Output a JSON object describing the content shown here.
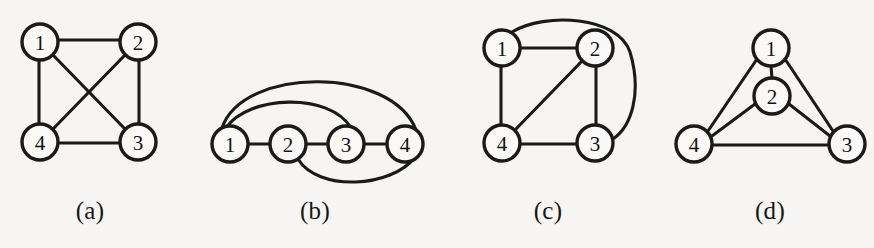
{
  "figure": {
    "background_color": "#f6f5f3",
    "ink_color": "#1a1a18",
    "node_fill_color": "#faf9f7",
    "panel_count": 4
  },
  "panels": [
    {
      "id": "a",
      "caption": "(a)",
      "layout": "square with both diagonals crossing",
      "node_labels": [
        "1",
        "2",
        "3",
        "4"
      ],
      "nodes": [
        {
          "label": "1",
          "cx": 40,
          "cy": 42,
          "r": 18
        },
        {
          "label": "2",
          "cx": 138,
          "cy": 42,
          "r": 18
        },
        {
          "label": "3",
          "cx": 138,
          "cy": 142,
          "r": 18
        },
        {
          "label": "4",
          "cx": 40,
          "cy": 142,
          "r": 18
        }
      ],
      "edges": [
        {
          "from": "1",
          "to": "2",
          "kind": "straight"
        },
        {
          "from": "2",
          "to": "3",
          "kind": "straight"
        },
        {
          "from": "3",
          "to": "4",
          "kind": "straight"
        },
        {
          "from": "4",
          "to": "1",
          "kind": "straight"
        },
        {
          "from": "1",
          "to": "3",
          "kind": "straight-diagonal"
        },
        {
          "from": "2",
          "to": "4",
          "kind": "straight-diagonal"
        }
      ],
      "edge_count": 6,
      "crossings": 1
    },
    {
      "id": "b",
      "caption": "(b)",
      "layout": "vertices in a row with arcs above and below",
      "node_labels": [
        "1",
        "2",
        "3",
        "4"
      ],
      "nodes": [
        {
          "label": "1",
          "cx": 230,
          "cy": 144,
          "r": 18
        },
        {
          "label": "2",
          "cx": 288,
          "cy": 144,
          "r": 18
        },
        {
          "label": "3",
          "cx": 346,
          "cy": 144,
          "r": 18
        },
        {
          "label": "4",
          "cx": 405,
          "cy": 144,
          "r": 18
        }
      ],
      "edges": [
        {
          "from": "1",
          "to": "2",
          "kind": "straight"
        },
        {
          "from": "2",
          "to": "3",
          "kind": "straight"
        },
        {
          "from": "3",
          "to": "4",
          "kind": "straight"
        },
        {
          "from": "1",
          "to": "3",
          "kind": "arc-above"
        },
        {
          "from": "1",
          "to": "4",
          "kind": "arc-above-large"
        },
        {
          "from": "2",
          "to": "4",
          "kind": "arc-below"
        }
      ],
      "edge_count": 6,
      "crossings": 1
    },
    {
      "id": "c",
      "caption": "(c)",
      "layout": "square with one diagonal and an outer curved edge",
      "node_labels": [
        "1",
        "2",
        "3",
        "4"
      ],
      "nodes": [
        {
          "label": "1",
          "cx": 502,
          "cy": 48,
          "r": 18
        },
        {
          "label": "2",
          "cx": 595,
          "cy": 48,
          "r": 18
        },
        {
          "label": "3",
          "cx": 595,
          "cy": 143,
          "r": 18
        },
        {
          "label": "4",
          "cx": 502,
          "cy": 143,
          "r": 18
        }
      ],
      "edges": [
        {
          "from": "1",
          "to": "2",
          "kind": "straight"
        },
        {
          "from": "2",
          "to": "3",
          "kind": "straight"
        },
        {
          "from": "3",
          "to": "4",
          "kind": "straight"
        },
        {
          "from": "4",
          "to": "1",
          "kind": "straight"
        },
        {
          "from": "2",
          "to": "4",
          "kind": "straight-diagonal"
        },
        {
          "from": "1",
          "to": "3",
          "kind": "curve-outside-right"
        }
      ],
      "edge_count": 6,
      "crossings": 0
    },
    {
      "id": "d",
      "caption": "(d)",
      "layout": "planar triangle with one vertex inside",
      "node_labels": [
        "1",
        "2",
        "3",
        "4"
      ],
      "nodes": [
        {
          "label": "1",
          "cx": 771,
          "cy": 48,
          "r": 18
        },
        {
          "label": "2",
          "cx": 772,
          "cy": 96,
          "r": 18
        },
        {
          "label": "3",
          "cx": 847,
          "cy": 144,
          "r": 18
        },
        {
          "label": "4",
          "cx": 694,
          "cy": 144,
          "r": 18
        }
      ],
      "edges": [
        {
          "from": "1",
          "to": "2",
          "kind": "straight"
        },
        {
          "from": "1",
          "to": "3",
          "kind": "straight"
        },
        {
          "from": "1",
          "to": "4",
          "kind": "straight"
        },
        {
          "from": "2",
          "to": "3",
          "kind": "straight"
        },
        {
          "from": "2",
          "to": "4",
          "kind": "straight"
        },
        {
          "from": "3",
          "to": "4",
          "kind": "straight"
        }
      ],
      "edge_count": 6,
      "crossings": 0
    }
  ]
}
